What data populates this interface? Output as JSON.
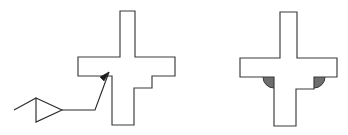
{
  "figure": {
    "title": "Cross-section profile comparison: sharp corners versus filleted corners",
    "background_color": "#ffffff",
    "width": 348,
    "height": 135,
    "outline_color": "#3a3a3a",
    "fill_color": "#ffffff",
    "fillet_color": "#6e6e6e",
    "leader_color": "#2b2b2b",
    "arrow_color": "#1a1a1a"
  },
  "left_figure": {
    "label": "sharp-corner-profile",
    "description": "Cross shaped section with square inner corners",
    "outline_points": "120,11 135,11 135,57 175,57 175,76 152,76 152,88 134,88 134,125 112,125 112,76 78,76 78,57 120,57",
    "corner_state": "sharp",
    "annotation": {
      "label": "corner-callout",
      "leader_start": "14,110",
      "leader_triangle_points": "36,98 62,110 36,122",
      "leader_mid": "86,110",
      "leader_elbow": "95,110",
      "arrow_tip": "109,72",
      "arrow_head_points": "109,72 100,77 104,81",
      "target_description": "Square inner corner where the lower stem meets the horizontal bar"
    }
  },
  "right_figure": {
    "label": "filleted-corner-profile",
    "description": "Same cross shaped section with rounded fillets added at the inner corners below the horizontal bar",
    "outline_points": "280,12 297,12 297,58 337,58 337,77 314,77 314,89 296,89 296,126 274,126 274,77 240,77 240,58 280,58",
    "corner_state": "filleted",
    "fillets": [
      {
        "label": "left-fillet",
        "center_x": 274,
        "center_y": 77,
        "radius": 11,
        "orientation": "lower-left",
        "color": "#6e6e6e"
      },
      {
        "label": "right-fillet",
        "center_x": 314,
        "center_y": 77,
        "radius": 11,
        "orientation": "lower-right",
        "color": "#6e6e6e"
      }
    ]
  }
}
